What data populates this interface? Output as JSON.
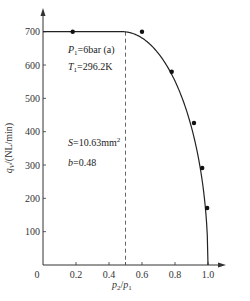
{
  "chart_data": {
    "type": "line",
    "title": "",
    "xlabel": "p2/p1",
    "ylabel": "qV/(NL/min)",
    "xlabel_parts": {
      "p": "p",
      "sub2": "2",
      "slash": "/",
      "p1": "p",
      "sub1": "1"
    },
    "ylabel_parts": {
      "q": "q",
      "sub": "V",
      "unit": "/(NL/min)"
    },
    "xlim": [
      0,
      1.1
    ],
    "ylim": [
      0,
      760
    ],
    "x_ticks": [
      0,
      0.2,
      0.4,
      0.5,
      0.6,
      0.8,
      1.0
    ],
    "x_tick_labels": [
      "0",
      "0.2",
      "0.4",
      "",
      "0.6",
      "0.8",
      "1.0"
    ],
    "y_ticks": [
      100,
      200,
      300,
      400,
      500,
      600,
      700
    ],
    "y_tick_labels": [
      "100",
      "200",
      "300",
      "400",
      "500",
      "600",
      "700"
    ],
    "grid": false,
    "critical_ratio_line": {
      "x": 0.5,
      "style": "dashed"
    },
    "series": [
      {
        "name": "fitted curve",
        "kind": "line",
        "b": 0.48,
        "q_max": 700,
        "x": [
          0,
          0.48,
          0.55,
          0.6,
          0.65,
          0.7,
          0.75,
          0.8,
          0.85,
          0.9,
          0.93,
          0.96,
          0.98,
          0.99,
          1.0
        ],
        "y": [
          700,
          700,
          693,
          680,
          660,
          634,
          599,
          556,
          501,
          430,
          373,
          298,
          223,
          165,
          0
        ]
      },
      {
        "name": "measured",
        "kind": "scatter",
        "x": [
          0.18,
          0.6,
          0.78,
          0.915,
          0.965,
          0.995
        ],
        "y": [
          700,
          700,
          580,
          426,
          291,
          171
        ]
      }
    ],
    "annotations": [
      {
        "id": "p1",
        "text_main": "P",
        "sub": "1",
        "text_rest": "=6bar (a)"
      },
      {
        "id": "t1",
        "text_main": "T",
        "sub": "1",
        "text_rest": "=296.2K"
      },
      {
        "id": "s",
        "text_main": "S",
        "text_rest": "=10.63mm",
        "sup": "2"
      },
      {
        "id": "b",
        "text_main": "b",
        "text_rest": "=0.48"
      }
    ],
    "colors": {
      "line": "#222222",
      "axis": "#333333",
      "marker": "#111111",
      "dash": "#555555"
    }
  }
}
